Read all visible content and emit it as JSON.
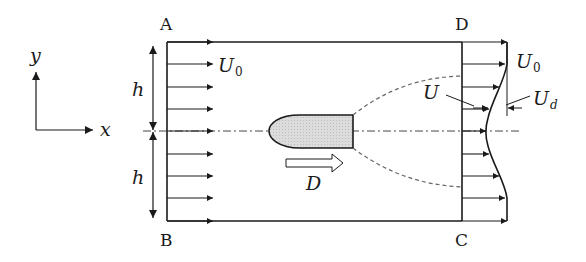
{
  "diagram": {
    "title": "",
    "corners": {
      "A": "A",
      "B": "B",
      "C": "C",
      "D": "D"
    },
    "axes": {
      "x_label": "x",
      "y_label": "y"
    },
    "dimensions": {
      "upper_half_label": "h",
      "lower_half_label": "h"
    },
    "inlet_velocity": {
      "symbol": "U",
      "subscript": "0"
    },
    "outlet_freestream_velocity": {
      "symbol": "U",
      "subscript": "0"
    },
    "wake_velocity": {
      "symbol": "U"
    },
    "velocity_deficit": {
      "symbol": "U",
      "subscript": "d"
    },
    "drag_force": {
      "symbol": "D"
    },
    "components": [
      "control-volume ABCD",
      "uniform inlet velocity profile (8 arrows)",
      "body (shaded, rounded nose)",
      "wake boundary (dashed)",
      "centerline (dash-dot)",
      "outlet velocity profile with deficit",
      "drag arrow D"
    ],
    "colors": {
      "line": "#1a1a1a",
      "body_fill": "#d9d9d9",
      "dashed": "#666666",
      "background": "#ffffff"
    }
  }
}
